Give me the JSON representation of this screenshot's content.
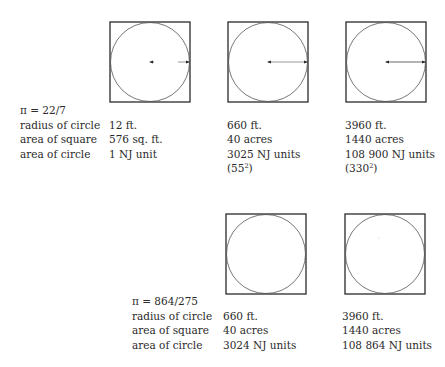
{
  "rows": [
    {
      "pi_label": "π = 22/7",
      "row_labels": [
        "radius of circle",
        "area of square",
        "area of circle"
      ],
      "columns": [
        {
          "radius": "12 ft.",
          "square_area": "576 sq. ft.",
          "circle_area": "1 NJ unit",
          "note": ""
        },
        {
          "radius": "660 ft.",
          "square_area": "40 acres",
          "circle_area": "3025 NJ units",
          "note_base": "(55",
          "note_exp": "2",
          "note_close": ")"
        },
        {
          "radius": "3960 ft.",
          "square_area": "1440 acres",
          "circle_area": "108 900 NJ units",
          "note_base": "(330",
          "note_exp": "2",
          "note_close": ")"
        }
      ]
    },
    {
      "pi_label": "π = 864/275",
      "row_labels": [
        "radius of circle",
        "area of square",
        "area of circle"
      ],
      "columns": [
        {
          "radius": "660 ft.",
          "square_area": "40 acres",
          "circle_area": "3024 NJ units"
        },
        {
          "radius": "3960 ft.",
          "square_area": "1440 acres",
          "circle_area": "108 864 NJ units"
        }
      ]
    }
  ],
  "colors": {
    "ink": "#2a2a2a",
    "background": "#ffffff"
  }
}
